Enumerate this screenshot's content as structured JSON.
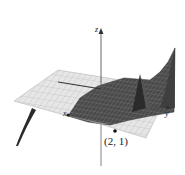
{
  "figure": {
    "type": "3d-surface-plot",
    "axes": {
      "x_label": "x",
      "y_label": "y",
      "z_label": "z"
    },
    "point": {
      "label": "(2, 1)",
      "x": 2,
      "y": 1
    },
    "colors": {
      "surface_dark": "#3a3a3a",
      "surface_mid": "#6e6e6e",
      "plane_light": "#e4e4e4",
      "grid_line": "#b5b5b5",
      "axis": "#555555"
    }
  }
}
